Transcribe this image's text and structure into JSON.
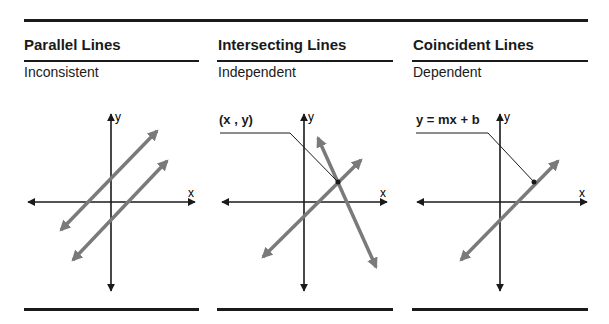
{
  "panels": [
    {
      "title": "Parallel Lines",
      "subtitle": "Inconsistent",
      "annotation": null
    },
    {
      "title": "Intersecting Lines",
      "subtitle": "Independent",
      "annotation": "(x , y)"
    },
    {
      "title": "Coincident Lines",
      "subtitle": "Dependent",
      "annotation": "y = mx + b"
    }
  ],
  "axes": {
    "x_label": "x",
    "y_label": "y"
  },
  "colors": {
    "axis": "#1a1a1a",
    "line": "#7a7a7a",
    "rule": "#1a1a1a"
  }
}
